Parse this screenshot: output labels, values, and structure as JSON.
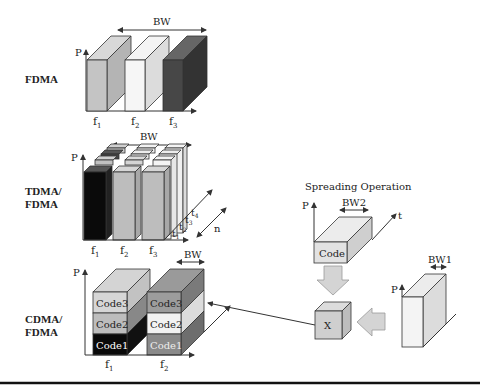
{
  "rows": {
    "fdma": {
      "label": "FDMA",
      "axis_p": "P",
      "bw": "BW",
      "freqs": [
        {
          "main": "f",
          "sub": "1"
        },
        {
          "main": "f",
          "sub": "2"
        },
        {
          "main": "f",
          "sub": "3"
        }
      ],
      "colors": {
        "f1": "#c4c4c4",
        "f2": "#f2f2f2",
        "f3": "#3a3a3a"
      }
    },
    "tdma": {
      "label_line1": "TDMA/",
      "label_line2": "FDMA",
      "axis_p": "P",
      "bw": "BW",
      "n": "n",
      "freqs": [
        {
          "main": "f",
          "sub": "1"
        },
        {
          "main": "f",
          "sub": "2"
        },
        {
          "main": "f",
          "sub": "3"
        }
      ],
      "times": [
        {
          "main": "t",
          "sub": "1"
        },
        {
          "main": "t",
          "sub": "2"
        },
        {
          "main": "t",
          "sub": "3"
        },
        {
          "main": "t",
          "sub": "4"
        }
      ]
    },
    "cdma": {
      "label_line1": "CDMA/",
      "label_line2": "FDMA",
      "axis_p": "P",
      "bw": "BW",
      "freqs": [
        {
          "main": "f",
          "sub": "1"
        },
        {
          "main": "f",
          "sub": "2"
        }
      ],
      "stack1": [
        "Code3",
        "Code2",
        "Code1"
      ],
      "stack2": [
        "Code3",
        "Code2",
        "Code1"
      ]
    }
  },
  "spreading": {
    "title": "Spreading Operation",
    "code_block": {
      "label": "Code",
      "axis_p": "P",
      "axis_t": "t",
      "bw": "BW2"
    },
    "multiplier": {
      "label": "X"
    },
    "signal_block": {
      "axis_p": "P",
      "bw": "BW1"
    }
  }
}
